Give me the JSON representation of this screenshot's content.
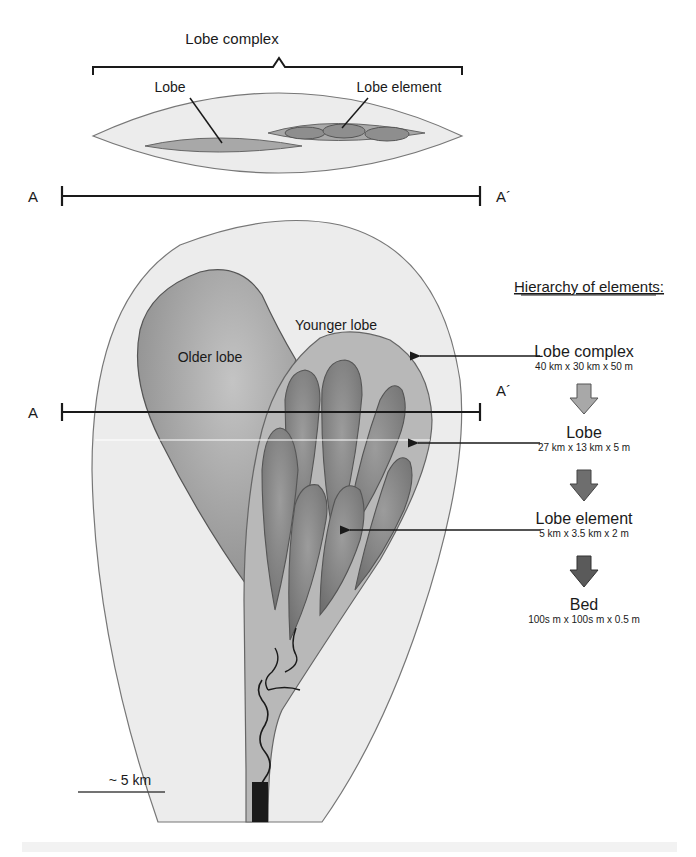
{
  "title": "Lobe complex",
  "cross_section": {
    "title": "Lobe complex",
    "lobe_label": "Lobe",
    "lobe_element_label": "Lobe element"
  },
  "section_lines": [
    {
      "left": "A",
      "right": "A´"
    },
    {
      "left": "A",
      "right": "A´"
    }
  ],
  "plan_view": {
    "older_lobe_label": "Older lobe",
    "younger_lobe_label": "Younger lobe",
    "scale_label": "~ 5 km"
  },
  "hierarchy": {
    "title": "Hierarchy of elements:",
    "levels": [
      {
        "name": "Lobe complex",
        "dims": "40 km x 30 km x 50 m",
        "arrow_color": "#a8a8a8"
      },
      {
        "name": "Lobe",
        "dims": "27 km x 13 km x 5 m",
        "arrow_color": "#6e6e6e"
      },
      {
        "name": "Lobe element",
        "dims": "5 km x 3.5 km x 2 m",
        "arrow_color": "#5a5a5a"
      },
      {
        "name": "Bed",
        "dims": "100s m x 100s m x 0.5 m"
      }
    ]
  },
  "colors": {
    "fan_fill": "#ececec",
    "older_lobe": "#9a9a9a",
    "younger_lobe": "#b4b4b4",
    "lobe_element": "#8a8a8a",
    "channel": "#1a1a1a"
  }
}
